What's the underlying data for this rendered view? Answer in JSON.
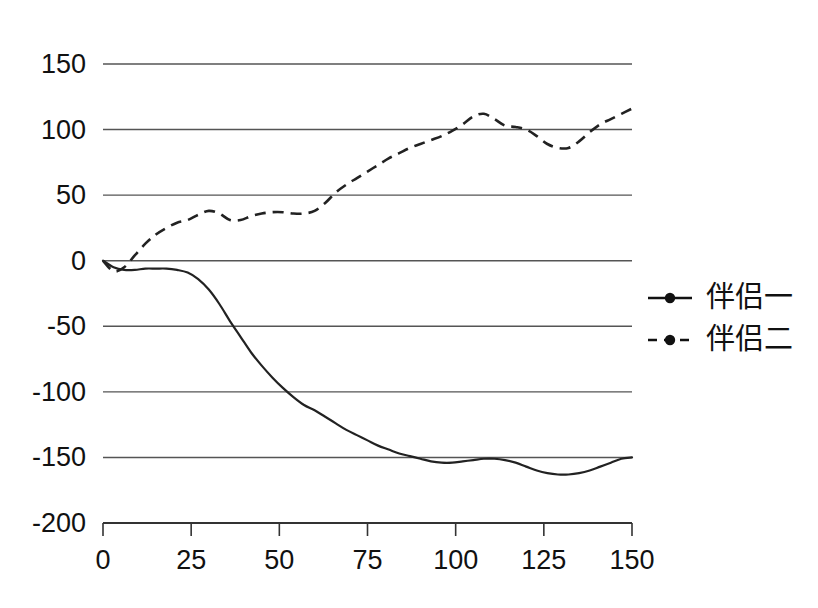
{
  "chart_data": {
    "type": "line",
    "title": "",
    "subtitle": "",
    "xlabel": "",
    "ylabel": "",
    "xlim": [
      0,
      150
    ],
    "ylim": [
      -200,
      150
    ],
    "xticks": [
      0,
      25,
      50,
      75,
      100,
      125,
      150
    ],
    "yticks": [
      150,
      100,
      50,
      0,
      -50,
      -100,
      -150,
      -200
    ],
    "xtick_labels": [
      "0",
      "25",
      "50",
      "75",
      "100",
      "125",
      "150"
    ],
    "ytick_labels": [
      "150",
      "100",
      "50",
      "0",
      "-50",
      "-100",
      "-150",
      "-200"
    ],
    "grid": true,
    "grid_axis": "y",
    "legend_position": "right",
    "line_color": "#222222",
    "grid_color": "#555555",
    "background": "#ffffff",
    "series": [
      {
        "name": "伴侣一",
        "style": "solid",
        "marker": "circle",
        "x": [
          0,
          3,
          6,
          9,
          12,
          15,
          18,
          21,
          24,
          27,
          30,
          33,
          36,
          39,
          42,
          45,
          48,
          51,
          54,
          57,
          60,
          63,
          66,
          69,
          72,
          75,
          78,
          81,
          84,
          87,
          90,
          93,
          96,
          99,
          102,
          105,
          108,
          111,
          114,
          117,
          120,
          123,
          126,
          129,
          132,
          135,
          138,
          141,
          144,
          147,
          150
        ],
        "values": [
          0,
          -5,
          -7,
          -7,
          -6,
          -6,
          -6,
          -7,
          -9,
          -14,
          -22,
          -33,
          -46,
          -58,
          -70,
          -80,
          -89,
          -97,
          -104,
          -110,
          -114,
          -119,
          -124,
          -129,
          -133,
          -137,
          -141,
          -144,
          -147,
          -149,
          -151,
          -153,
          -154,
          -154,
          -153,
          -152,
          -151,
          -151,
          -152,
          -154,
          -157,
          -160,
          -162,
          -163,
          -163,
          -162,
          -160,
          -157,
          -154,
          -151,
          -150
        ]
      },
      {
        "name": "伴侣二",
        "style": "dashed",
        "marker": "circle",
        "x": [
          0,
          3,
          6,
          9,
          12,
          15,
          18,
          21,
          24,
          27,
          30,
          33,
          36,
          39,
          42,
          45,
          48,
          51,
          54,
          57,
          60,
          63,
          66,
          69,
          72,
          75,
          78,
          81,
          84,
          87,
          90,
          93,
          96,
          99,
          102,
          105,
          108,
          111,
          114,
          117,
          120,
          123,
          126,
          129,
          132,
          135,
          138,
          141,
          144,
          147,
          150
        ],
        "values": [
          0,
          -8,
          -5,
          4,
          13,
          20,
          25,
          29,
          31,
          35,
          38,
          36,
          31,
          31,
          34,
          36,
          37,
          37,
          36,
          36,
          38,
          44,
          52,
          58,
          63,
          68,
          73,
          78,
          82,
          86,
          89,
          92,
          95,
          99,
          104,
          110,
          112,
          108,
          103,
          102,
          100,
          95,
          89,
          86,
          86,
          91,
          98,
          104,
          108,
          112,
          116
        ]
      }
    ]
  },
  "legend": {
    "entries": [
      {
        "label": "伴侣一",
        "style": "solid",
        "marker": "circle"
      },
      {
        "label": "伴侣二",
        "style": "dashed",
        "marker": "circle"
      }
    ]
  }
}
